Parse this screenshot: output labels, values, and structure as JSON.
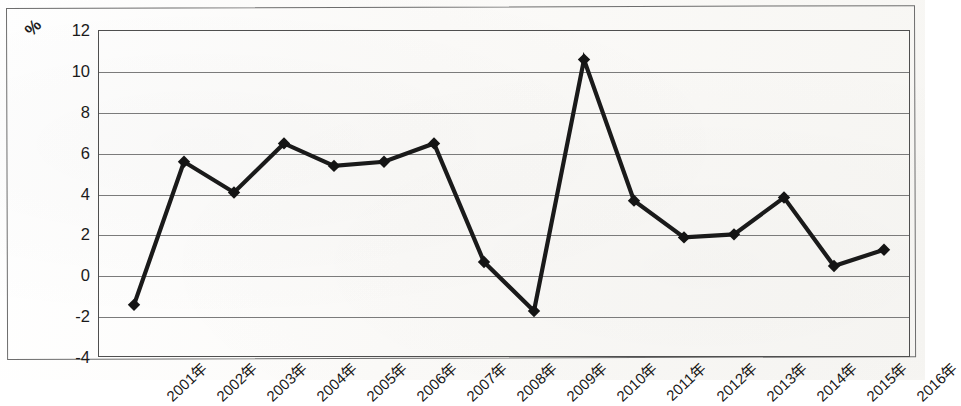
{
  "axis": {
    "unit_label": "%",
    "y_ticks": [
      12,
      10,
      8,
      6,
      4,
      2,
      0,
      -2,
      -4
    ],
    "x_ticks": [
      "2001年",
      "2002年",
      "2003年",
      "2004年",
      "2005年",
      "2006年",
      "2007年",
      "2008年",
      "2009年",
      "2010年",
      "2011年",
      "2012年",
      "2013年",
      "2014年",
      "2015年",
      "2016年"
    ]
  },
  "style": {
    "line_color": "#1a1a1a",
    "marker_color": "#141414",
    "grid_color": "#7b7b7b",
    "frame_color": "#4f4f4f",
    "background": "#fdfdfc"
  },
  "chart_data": {
    "type": "line",
    "title": "",
    "subtitle": "",
    "xlabel": "",
    "ylabel": "%",
    "ylim": [
      -4,
      12
    ],
    "ytick_step": 2,
    "grid": true,
    "legend": false,
    "marker": "diamond",
    "categories": [
      "2001年",
      "2002年",
      "2003年",
      "2004年",
      "2005年",
      "2006年",
      "2007年",
      "2008年",
      "2009年",
      "2010年",
      "2011年",
      "2012年",
      "2013年",
      "2014年",
      "2015年",
      "2016年"
    ],
    "series": [
      {
        "name": "",
        "values": [
          -1.4,
          5.6,
          4.1,
          6.5,
          5.4,
          5.6,
          6.5,
          0.7,
          -1.7,
          10.6,
          3.7,
          1.9,
          2.05,
          3.85,
          0.5,
          1.3
        ]
      }
    ]
  }
}
